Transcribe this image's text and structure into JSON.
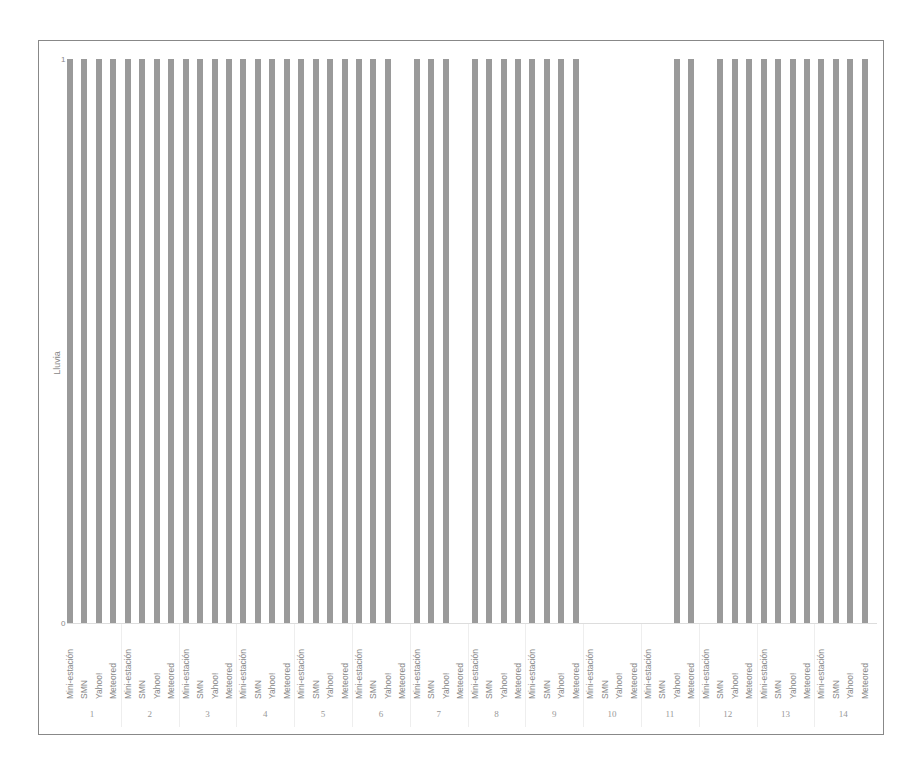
{
  "chart_data": {
    "type": "bar",
    "title": "",
    "xlabel": "",
    "ylabel": "Lluvia",
    "ylim": [
      0,
      1
    ],
    "yticks": [
      "0",
      "1"
    ],
    "grid": false,
    "legend": null,
    "bar_color": "#9a9a9a",
    "subcategories": [
      "Mini-estación",
      "SMN",
      "Yahoo!",
      "Meteored"
    ],
    "groups": [
      "1",
      "2",
      "3",
      "4",
      "5",
      "6",
      "7",
      "8",
      "9",
      "10",
      "11",
      "12",
      "13",
      "14"
    ],
    "values": [
      [
        1,
        1,
        1,
        1
      ],
      [
        1,
        1,
        1,
        1
      ],
      [
        1,
        1,
        1,
        1
      ],
      [
        1,
        1,
        1,
        1
      ],
      [
        1,
        1,
        1,
        1
      ],
      [
        1,
        1,
        1,
        0
      ],
      [
        1,
        1,
        1,
        0
      ],
      [
        1,
        1,
        1,
        1
      ],
      [
        1,
        1,
        1,
        1
      ],
      [
        0,
        0,
        0,
        0
      ],
      [
        0,
        0,
        1,
        1
      ],
      [
        0,
        1,
        1,
        1
      ],
      [
        1,
        1,
        1,
        1
      ],
      [
        1,
        1,
        1,
        1
      ]
    ]
  }
}
